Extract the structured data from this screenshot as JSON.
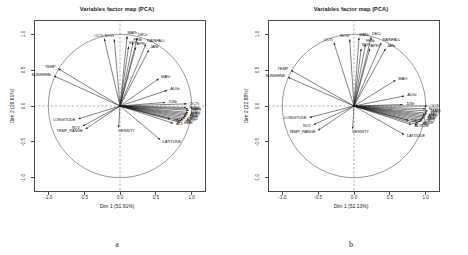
{
  "figure": {
    "panels": [
      {
        "id": "a",
        "letter": "a",
        "title": "Variables factor map (PCA)",
        "xlabel": "Dim 1 (51.91%)",
        "ylabel": "Dim 2 (26.61%)",
        "xticks": [
          "-1.0",
          "-0.5",
          "0.0",
          "0.5",
          "1.0"
        ],
        "yticks": [
          "-1.0",
          "-0.5",
          "0.0",
          "0.5",
          "1.0"
        ]
      },
      {
        "id": "b",
        "letter": "b",
        "title": "Variables factor map (PCA)",
        "xlabel": "Dim 1 (52.13%)",
        "ylabel": "Dim 2 (22.88%)",
        "xticks": [
          "-1.0",
          "-0.5",
          "0.0",
          "0.5",
          "1.0"
        ],
        "yticks": [
          "-1.0",
          "-0.5",
          "0.0",
          "0.5",
          "1.0"
        ]
      }
    ]
  },
  "chart_data": [
    {
      "type": "scatter",
      "subtype": "pca-correlation-circle",
      "title": "Variables factor map (PCA)",
      "panel": "a",
      "xlabel": "Dim 1 (51.91%)",
      "ylabel": "Dim 2 (26.61%)",
      "xlim": [
        -1.2,
        1.2
      ],
      "ylim": [
        -1.2,
        1.2
      ],
      "xticks": [
        -1.0,
        -0.5,
        0.0,
        0.5,
        1.0
      ],
      "yticks": [
        -1.0,
        -0.5,
        0.0,
        0.5,
        1.0
      ],
      "grid": false,
      "unit_circle": true,
      "legend": "none",
      "variables": [
        {
          "label": "OCTr",
          "x": -0.22,
          "y": 0.94
        },
        {
          "label": "NOVr",
          "x": -0.08,
          "y": 0.93
        },
        {
          "label": "MARr",
          "x": 0.1,
          "y": 0.97
        },
        {
          "label": "DECr",
          "x": 0.24,
          "y": 0.95
        },
        {
          "label": "FEBr",
          "x": 0.18,
          "y": 0.88
        },
        {
          "label": "SEPr",
          "x": 0.12,
          "y": 0.83
        },
        {
          "label": "APRr",
          "x": 0.22,
          "y": 0.82
        },
        {
          "label": "RAINFALL",
          "x": 0.36,
          "y": 0.86
        },
        {
          "label": "JANr",
          "x": 0.4,
          "y": 0.78
        },
        {
          "label": "TEMP",
          "x": -0.86,
          "y": 0.52
        },
        {
          "label": "SUNSHINE",
          "x": -0.92,
          "y": 0.42
        },
        {
          "label": "MAYr",
          "x": 0.54,
          "y": 0.38
        },
        {
          "label": "AUGr",
          "x": 0.66,
          "y": 0.22
        },
        {
          "label": "JUNr",
          "x": 0.63,
          "y": 0.05
        },
        {
          "label": "OCTt",
          "x": 0.93,
          "y": 0.03
        },
        {
          "label": "NOVt",
          "x": 0.92,
          "y": -0.02
        },
        {
          "label": "MARt",
          "x": 0.95,
          "y": -0.04
        },
        {
          "label": "SEPt",
          "x": 0.96,
          "y": -0.06
        },
        {
          "label": "MAYt",
          "x": 0.95,
          "y": -0.09
        },
        {
          "label": "APRt",
          "x": 0.94,
          "y": -0.11
        },
        {
          "label": "FEBt",
          "x": 0.93,
          "y": -0.13
        },
        {
          "label": "JANt",
          "x": 0.92,
          "y": -0.15
        },
        {
          "label": "DECt",
          "x": 0.91,
          "y": -0.17
        },
        {
          "label": "AUGt",
          "x": 0.88,
          "y": -0.19
        },
        {
          "label": "JULt",
          "x": 0.86,
          "y": -0.21
        },
        {
          "label": "JUNt",
          "x": 0.84,
          "y": -0.23
        },
        {
          "label": "DAYS",
          "x": 0.7,
          "y": -0.18
        },
        {
          "label": "ALT",
          "x": 0.74,
          "y": -0.24
        },
        {
          "label": "LONGITUDE",
          "x": -0.58,
          "y": -0.18
        },
        {
          "label": "NO2",
          "x": -0.52,
          "y": -0.28
        },
        {
          "label": "TEMP_RANGE",
          "x": -0.48,
          "y": -0.32
        },
        {
          "label": "DENSITY",
          "x": -0.02,
          "y": -0.3
        },
        {
          "label": "LATITUDE",
          "x": 0.56,
          "y": -0.47
        }
      ]
    },
    {
      "type": "scatter",
      "subtype": "pca-correlation-circle",
      "title": "Variables factor map (PCA)",
      "panel": "b",
      "xlabel": "Dim 1 (52.13%)",
      "ylabel": "Dim 2 (22.88%)",
      "xlim": [
        -1.2,
        1.2
      ],
      "ylim": [
        -1.2,
        1.2
      ],
      "xticks": [
        -1.0,
        -0.5,
        0.0,
        0.5,
        1.0
      ],
      "yticks": [
        -1.0,
        -0.5,
        0.0,
        0.5,
        1.0
      ],
      "grid": false,
      "unit_circle": true,
      "legend": "none",
      "variables": [
        {
          "label": "OCTr",
          "x": -0.28,
          "y": 0.88
        },
        {
          "label": "NOVr",
          "x": -0.06,
          "y": 0.93
        },
        {
          "label": "MARr",
          "x": 0.07,
          "y": 0.95
        },
        {
          "label": "DECr",
          "x": 0.24,
          "y": 0.96
        },
        {
          "label": "FEBr",
          "x": 0.16,
          "y": 0.86
        },
        {
          "label": "SEPr",
          "x": 0.1,
          "y": 0.8
        },
        {
          "label": "APRr",
          "x": 0.22,
          "y": 0.8
        },
        {
          "label": "RAINFALL",
          "x": 0.38,
          "y": 0.88
        },
        {
          "label": "JANr",
          "x": 0.44,
          "y": 0.8
        },
        {
          "label": "TEMP",
          "x": -0.88,
          "y": 0.5
        },
        {
          "label": "SUNSHINE",
          "x": -0.92,
          "y": 0.4
        },
        {
          "label": "MAYr",
          "x": 0.58,
          "y": 0.36
        },
        {
          "label": "AUGr",
          "x": 0.7,
          "y": 0.14
        },
        {
          "label": "JUNr",
          "x": 0.68,
          "y": 0.02
        },
        {
          "label": "OCTt",
          "x": 1.02,
          "y": 0.0
        },
        {
          "label": "NOVt",
          "x": 1.0,
          "y": -0.04
        },
        {
          "label": "MARt",
          "x": 1.03,
          "y": -0.07
        },
        {
          "label": "SEPt",
          "x": 1.02,
          "y": -0.1
        },
        {
          "label": "MAYt",
          "x": 1.0,
          "y": -0.12
        },
        {
          "label": "APRt",
          "x": 0.99,
          "y": -0.14
        },
        {
          "label": "FEBt",
          "x": 0.98,
          "y": -0.16
        },
        {
          "label": "JANt",
          "x": 0.97,
          "y": -0.18
        },
        {
          "label": "DECt",
          "x": 0.95,
          "y": -0.2
        },
        {
          "label": "AUGt",
          "x": 0.93,
          "y": -0.22
        },
        {
          "label": "JULt",
          "x": 0.9,
          "y": -0.24
        },
        {
          "label": "JUNt",
          "x": 0.88,
          "y": -0.26
        },
        {
          "label": "DAYS",
          "x": 0.76,
          "y": -0.2
        },
        {
          "label": "ALT",
          "x": 0.8,
          "y": -0.26
        },
        {
          "label": "LONGITUDE",
          "x": -0.62,
          "y": -0.16
        },
        {
          "label": "NO2",
          "x": -0.56,
          "y": -0.26
        },
        {
          "label": "TEMP_RANGE",
          "x": -0.5,
          "y": -0.34
        },
        {
          "label": "DENSITY",
          "x": -0.02,
          "y": -0.32
        },
        {
          "label": "LATITUDE",
          "x": 0.7,
          "y": -0.4
        }
      ]
    }
  ],
  "style": {
    "axis_color": "#4a4a4a",
    "arrow_color": "#1a1a1a",
    "dashed_color": "#6e6e6e",
    "circle_color": "#555555",
    "text_color": "#111111"
  }
}
